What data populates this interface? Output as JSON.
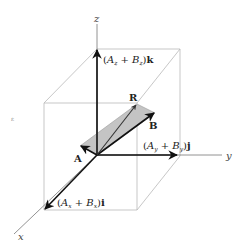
{
  "figure": {
    "type": "3d-vector-addition",
    "colors": {
      "background": "#ffffff",
      "cube_edges": "#b9b9b9",
      "axes": "#777777",
      "vectors": "#111111",
      "parallelogram_fill": "#c4c4c4"
    },
    "axes": {
      "x_label": "x",
      "y_label": "y",
      "z_label": "z"
    },
    "vectors": {
      "A": "A",
      "B": "B",
      "R": "R"
    },
    "components": {
      "x": {
        "open": "(",
        "a": "A",
        "a_sub": "x",
        "plus": " + ",
        "b": "B",
        "b_sub": "x",
        "close": ")",
        "unit": "i"
      },
      "y": {
        "open": "(",
        "a": "A",
        "a_sub": "y",
        "plus": " + ",
        "b": "B",
        "b_sub": "y",
        "close": ")",
        "unit": "j"
      },
      "z": {
        "open": "(",
        "a": "A",
        "a_sub": "z",
        "plus": " + ",
        "b": "B",
        "b_sub": "z",
        "close": ")",
        "unit": "k"
      }
    },
    "stray_mark": "ε"
  }
}
